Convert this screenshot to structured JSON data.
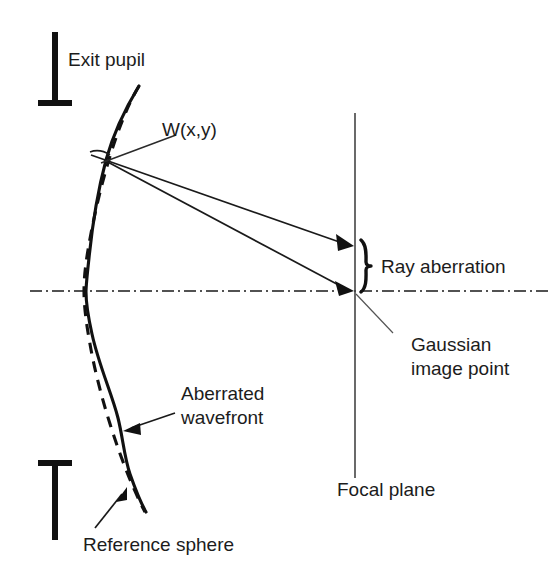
{
  "figure": {
    "background_color": "#ffffff",
    "ink_color": "#111111"
  },
  "labels": {
    "exit_pupil": "Exit pupil",
    "wavefront_function": "W(x,y)",
    "ray_aberration": "Ray aberration",
    "gaussian_line1": "Gaussian",
    "gaussian_line2": "image point",
    "aberrated_line1": "Aberrated",
    "aberrated_line2": "wavefront",
    "reference_sphere": "Reference sphere",
    "focal_plane": "Focal plane"
  },
  "elements": {
    "reference_sphere_style": "dashed",
    "aberrated_wavefront_style": "solid",
    "optical_axis_style": "dash-dot",
    "focal_plane_style": "solid-vertical",
    "ray_count": 2,
    "brace_orientation": "left-facing"
  },
  "geometry": {
    "optical_axis_y": 291,
    "focal_plane_x": 355,
    "focal_plane_top_y": 113,
    "focal_plane_bottom_y": 478,
    "upper_ray_hit_y": 245,
    "lower_ray_hit_y": 291,
    "wavefront_vertex_x": 86,
    "wavefront_top_y": 85,
    "wavefront_bottom_y": 512,
    "upper_pupil_bar_top_y": 32,
    "upper_pupil_bar_bottom_y": 106,
    "lower_pupil_bar_top_y": 460,
    "lower_pupil_bar_bottom_y": 540,
    "pupil_bar_x": 55
  }
}
